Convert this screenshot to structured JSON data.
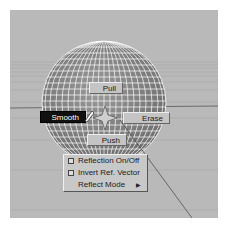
{
  "viewport": {
    "background": "#b9b9b9",
    "sphere_color": "#8c8c8c",
    "wire_color": "#ffffff"
  },
  "marking_menu": {
    "items": [
      {
        "label": "Pull",
        "position": "north",
        "active": false
      },
      {
        "label": "Smooth",
        "position": "west",
        "active": true
      },
      {
        "label": "Erase",
        "position": "east",
        "active": false
      },
      {
        "label": "Push",
        "position": "south",
        "active": false
      }
    ]
  },
  "quad_menu": {
    "items": [
      {
        "label": "Reflection On/Off",
        "type": "checkbox",
        "checked": false
      },
      {
        "label": "Invert Ref. Vector",
        "type": "checkbox",
        "checked": false
      },
      {
        "label": "Reflect Mode",
        "type": "submenu"
      }
    ]
  }
}
